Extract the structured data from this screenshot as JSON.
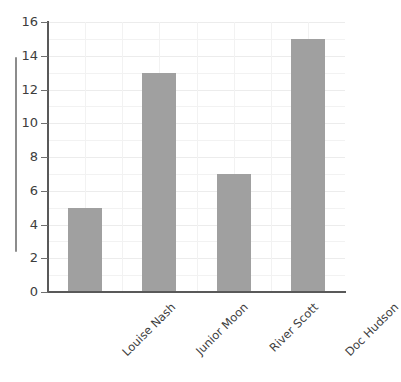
{
  "chart_data": {
    "type": "bar",
    "title": "",
    "title_cropped": true,
    "xlabel": "",
    "ylabel": "",
    "categories": [
      "Louise Nash",
      "Junior Moon",
      "River Scott",
      "Doc Hudson"
    ],
    "values": [
      5,
      13,
      7,
      15
    ],
    "ylim": [
      0,
      16
    ],
    "ytick_labels": [
      "0",
      "2",
      "4",
      "6",
      "8",
      "10",
      "12",
      "14",
      "16"
    ],
    "ytick_values": [
      0,
      2,
      4,
      6,
      8,
      10,
      12,
      14,
      16
    ],
    "minor_gridline_step": 1,
    "grid": true,
    "legend": false,
    "xtick_rotation": -45,
    "colors": {
      "bar": "#a0a0a0",
      "axis": "#595959",
      "gridline": "#f2f2f2",
      "gridline_major": "#ececec",
      "tick_label": "#3d3d3d",
      "background": "#ffffff",
      "scroll_indicator": "#8c8c8c"
    }
  },
  "scrollbar": {
    "name": "vertical-scroll-indicator"
  }
}
